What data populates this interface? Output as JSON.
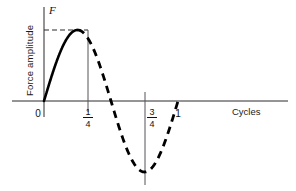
{
  "chart_data": {
    "type": "line",
    "title": "",
    "xlabel": "Cycles",
    "ylabel": "Force amplitude",
    "yaxis_symbol": "F",
    "xlim": [
      0,
      1.18
    ],
    "ylim": [
      -1.15,
      1.15
    ],
    "grid": false,
    "legend": null,
    "x_tick_labels": [
      "0",
      "1/4",
      "3/4",
      "1"
    ],
    "x_tick_values": [
      0,
      0.25,
      0.75,
      1
    ],
    "x_tick_display": [
      {
        "label": "0",
        "value": 0,
        "kind": "integer"
      },
      {
        "label": "1/4",
        "value": 0.25,
        "kind": "fraction",
        "numerator": "1",
        "denominator": "4"
      },
      {
        "label": "3/4",
        "value": 0.75,
        "kind": "fraction",
        "numerator": "3",
        "denominator": "4"
      },
      {
        "label": "1",
        "value": 1,
        "kind": "integer"
      }
    ],
    "y_tick_labels": [],
    "series": [
      {
        "name": "Force amplitude",
        "function": "sin(2*pi*x)",
        "solid_range": [
          0,
          0.25
        ],
        "dashed_range": [
          0.25,
          1.0
        ],
        "x": [
          0,
          0.0625,
          0.125,
          0.1875,
          0.25,
          0.3125,
          0.375,
          0.4375,
          0.5,
          0.5625,
          0.625,
          0.6875,
          0.75,
          0.8125,
          0.875,
          0.9375,
          1.0
        ],
        "values": [
          0,
          0.383,
          0.707,
          0.924,
          1.0,
          0.924,
          0.707,
          0.383,
          0,
          -0.383,
          -0.707,
          -0.924,
          -1.0,
          -0.924,
          -0.707,
          -0.383,
          0
        ]
      }
    ],
    "annotations": [
      {
        "name": "peak-reference-line",
        "type": "dashed-horizontal",
        "y": 1.0,
        "from_x": 0,
        "to_x": 0.25
      },
      {
        "name": "quarter-cycle-marker",
        "type": "vertical-line",
        "x": 0.25,
        "from_y": 0,
        "to_y": 1.0
      },
      {
        "name": "three-quarter-cycle-marker",
        "type": "vertical-line",
        "x": 0.75,
        "from_y": 0,
        "to_y": -1.18
      }
    ],
    "colors": {
      "curve": "#000000",
      "axis": "#2b2b2b",
      "text": "#111111",
      "background": "#ffffff"
    }
  }
}
